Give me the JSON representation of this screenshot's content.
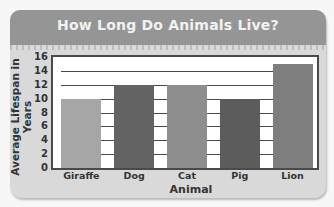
{
  "chart_data": {
    "type": "bar",
    "title": "How Long Do Animals Live?",
    "xlabel": "Animal",
    "ylabel": "Average Lifespan in Years",
    "categories": [
      "Giraffe",
      "Dog",
      "Cat",
      "Pig",
      "Lion"
    ],
    "values": [
      10,
      12,
      12,
      10,
      15
    ],
    "ylim": [
      0,
      16
    ],
    "yticks": [
      0,
      2,
      4,
      6,
      8,
      10,
      12,
      14,
      16
    ],
    "grid": true,
    "bar_colors": [
      "#a6a6a6",
      "#636363",
      "#8e8e8e",
      "#5c5c5c",
      "#7e7e7e"
    ]
  },
  "ytick_labels": [
    "0",
    "2",
    "4",
    "6",
    "8",
    "10",
    "12",
    "14",
    "16"
  ]
}
